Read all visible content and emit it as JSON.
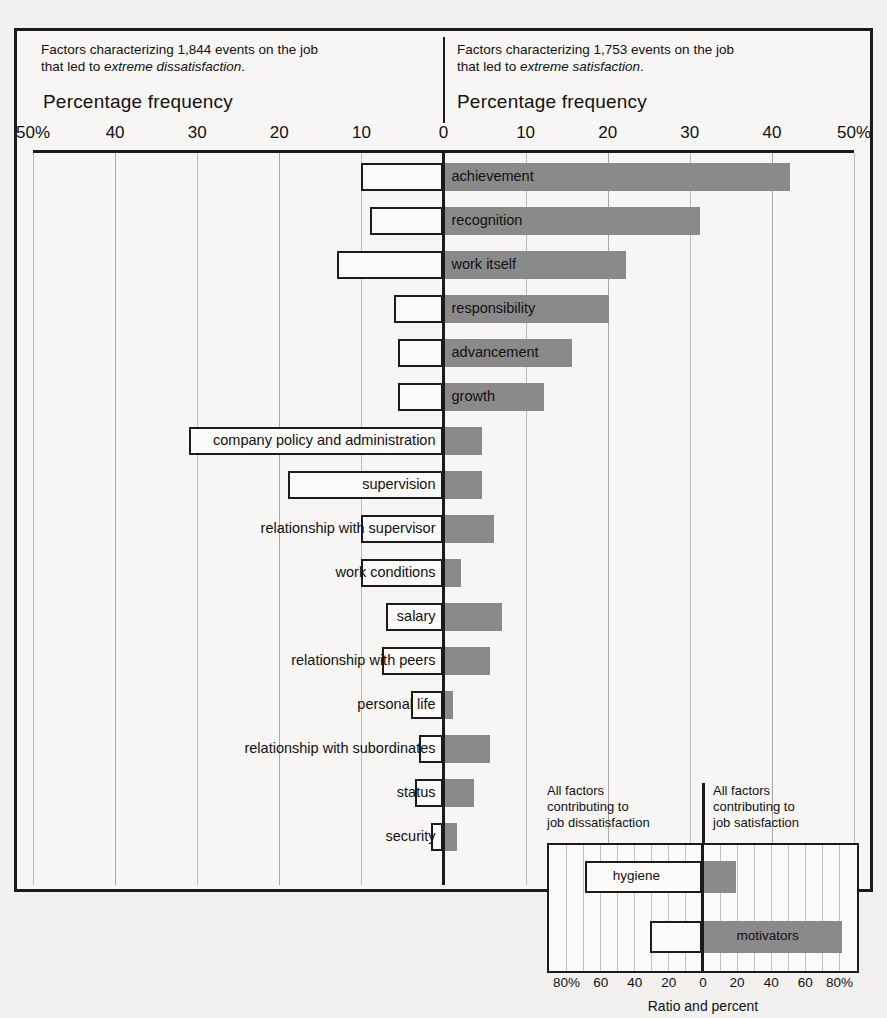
{
  "header": {
    "left_line1": "Factors characterizing 1,844 events on the job",
    "left_line2_prefix": "that led to ",
    "left_line2_em": "extreme dissatisfaction",
    "left_line2_suffix": ".",
    "right_line1": "Factors characterizing 1,753 events on the job",
    "right_line2_prefix": "that led to ",
    "right_line2_em": "extreme satisfaction",
    "right_line2_suffix": ".",
    "left_axis_title": "Percentage frequency",
    "right_axis_title": "Percentage frequency"
  },
  "scale_ticks": [
    {
      "label": "50%",
      "value": -50
    },
    {
      "label": "40",
      "value": -40
    },
    {
      "label": "30",
      "value": -30
    },
    {
      "label": "20",
      "value": -20
    },
    {
      "label": "10",
      "value": -10
    },
    {
      "label": "0",
      "value": 0
    },
    {
      "label": "10",
      "value": 10
    },
    {
      "label": "20",
      "value": 20
    },
    {
      "label": "30",
      "value": 30
    },
    {
      "label": "40",
      "value": 40
    },
    {
      "label": "50%",
      "value": 50
    }
  ],
  "inset": {
    "caption_left": "All factors contributing to job dissatisfaction",
    "caption_left_lines": [
      "All factors",
      "contributing to",
      "job dissatisfaction"
    ],
    "caption_right_lines": [
      "All factors",
      "contributing to",
      "job satisfaction"
    ],
    "xlabel": "Ratio and percent",
    "ticks": [
      {
        "label": "80%",
        "value": -80
      },
      {
        "label": "60",
        "value": -60
      },
      {
        "label": "40",
        "value": -40
      },
      {
        "label": "20",
        "value": -20
      },
      {
        "label": "0",
        "value": 0
      },
      {
        "label": "20",
        "value": 20
      },
      {
        "label": "40",
        "value": 40
      },
      {
        "label": "60",
        "value": 60
      },
      {
        "label": "80%",
        "value": 80
      }
    ],
    "rows": [
      {
        "label": "hygiene",
        "dissatisfaction": 69,
        "satisfaction": 19,
        "label_side": "left"
      },
      {
        "label": "motivators",
        "dissatisfaction": 31,
        "satisfaction": 81,
        "label_side": "right"
      }
    ]
  },
  "colors": {
    "satisfaction_bar": "#8a8a8a",
    "dissatisfaction_bar": "#fbfaf8",
    "outline": "#1b1b1b",
    "grid": "#bdbcba",
    "page_background": "#f2f1ef"
  },
  "chart_data": {
    "type": "bar",
    "orientation": "horizontal",
    "layout": "bidirectional-tornado",
    "xlabel": "Percentage frequency",
    "ylabel": "",
    "xlim": [
      -50,
      50
    ],
    "xtick_step": 10,
    "grid": true,
    "legend_position": "none",
    "series": [
      {
        "name": "Factors characterizing 1,844 events on the job that led to extreme dissatisfaction",
        "direction": "left",
        "style": "white bar with black outline",
        "values": [
          10,
          9,
          13,
          6,
          5.5,
          5.5,
          31,
          19,
          10,
          10,
          7,
          7.5,
          4,
          3,
          3.5,
          1.5
        ]
      },
      {
        "name": "Factors characterizing 1,753 events on the job that led to extreme satisfaction",
        "direction": "right",
        "style": "solid gray bar",
        "values": [
          42,
          31,
          22,
          20,
          15.5,
          12,
          4.5,
          4.5,
          6,
          2,
          7,
          5.5,
          1,
          5.5,
          3.5,
          1.5
        ]
      }
    ],
    "categories": [
      "achievement",
      "recognition",
      "work itself",
      "responsibility",
      "advancement",
      "growth",
      "company policy and administration",
      "supervision",
      "relationship with supervisor",
      "work conditions",
      "salary",
      "relationship with peers",
      "personal life",
      "relationship with subordinates",
      "status",
      "security"
    ],
    "annotations": [
      "Top six categories are motivators; bottom ten are hygiene factors.",
      "Inset: all factors contributing to job dissatisfaction vs. job satisfaction — Ratio and percent"
    ]
  },
  "rows": [
    {
      "label": "achievement",
      "neg": 10,
      "pos": 42,
      "label_side": "right",
      "group": "motivator"
    },
    {
      "label": "recognition",
      "neg": 9,
      "pos": 31,
      "label_side": "right",
      "group": "motivator"
    },
    {
      "label": "work itself",
      "neg": 13,
      "pos": 22,
      "label_side": "right",
      "group": "motivator"
    },
    {
      "label": "responsibility",
      "neg": 6,
      "pos": 20,
      "label_side": "right",
      "group": "motivator"
    },
    {
      "label": "advancement",
      "neg": 5.5,
      "pos": 15.5,
      "label_side": "right",
      "group": "motivator"
    },
    {
      "label": "growth",
      "neg": 5.5,
      "pos": 12,
      "label_side": "right",
      "group": "motivator"
    },
    {
      "label": "company policy and administration",
      "neg": 31,
      "pos": 4.5,
      "label_side": "left",
      "group": "hygiene"
    },
    {
      "label": "supervision",
      "neg": 19,
      "pos": 4.5,
      "label_side": "left",
      "group": "hygiene"
    },
    {
      "label": "relationship with supervisor",
      "neg": 10,
      "pos": 6,
      "label_side": "left",
      "group": "hygiene"
    },
    {
      "label": "work conditions",
      "neg": 10,
      "pos": 2,
      "label_side": "left",
      "group": "hygiene"
    },
    {
      "label": "salary",
      "neg": 7,
      "pos": 7,
      "label_side": "left",
      "group": "hygiene"
    },
    {
      "label": "relationship with peers",
      "neg": 7.5,
      "pos": 5.5,
      "label_side": "left",
      "group": "hygiene"
    },
    {
      "label": "personal life",
      "neg": 4,
      "pos": 1,
      "label_side": "left",
      "group": "hygiene"
    },
    {
      "label": "relationship with subordinates",
      "neg": 3,
      "pos": 5.5,
      "label_side": "left",
      "group": "hygiene"
    },
    {
      "label": "status",
      "neg": 3.5,
      "pos": 3.5,
      "label_side": "left",
      "group": "hygiene"
    },
    {
      "label": "security",
      "neg": 1.5,
      "pos": 1.5,
      "label_side": "left",
      "group": "hygiene"
    }
  ]
}
